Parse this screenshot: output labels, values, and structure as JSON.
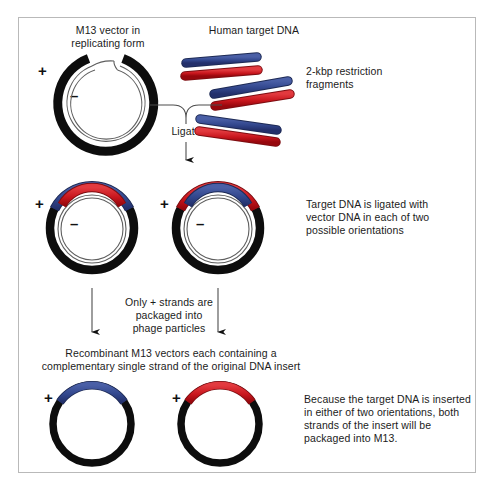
{
  "figure": {
    "title_top_left": "M13 vector in\nreplicating form",
    "title_top_right": "Human target DNA",
    "label_fragments": "2-kbp restriction\nfragments",
    "label_ligate": "Ligate",
    "label_ligated_note": "Target DNA is ligated with\nvector DNA in each of two\npossible orientations",
    "label_packaging": "Only + strands are\npackaged into\nphage particles",
    "label_recombinant": "Recombinant M13 vectors each containing a\ncomplementary single strand of the original DNA insert",
    "label_conclusion": "Because the target DNA is inserted\nin either of two orientations, both\nstrands of the insert will be\npackaged into M13.",
    "plus_sign": "+",
    "minus_sign": "–"
  },
  "colors": {
    "blue": "#31468c",
    "blue_dark": "#1d2a55",
    "red": "#c8161d",
    "red_dark": "#7d0d11",
    "black": "#0d0d0d",
    "thin_line": "#6a6a6a",
    "frame": "#b9b9b9",
    "background": "#ffffff"
  },
  "diagram_data": {
    "type": "diagram",
    "stages": [
      {
        "name": "top-stage",
        "elements": [
          {
            "kind": "vector-circle",
            "label": "M13 vector in replicating form",
            "strands": [
              "+",
              "–"
            ],
            "gap_top": true
          },
          {
            "kind": "dna-fragment-pair",
            "count": 3,
            "strand_colors": [
              "blue",
              "red"
            ],
            "label": "2-kbp restriction fragments"
          }
        ]
      },
      {
        "name": "ligation-stage",
        "elements": [
          {
            "kind": "ligated-circle",
            "orientation": "blue-outer-red-inner",
            "strands": [
              "+",
              "–"
            ]
          },
          {
            "kind": "ligated-circle",
            "orientation": "red-outer-blue-inner",
            "strands": [
              "+",
              "–"
            ]
          }
        ],
        "note": "Target DNA is ligated with vector DNA in each of two possible orientations"
      },
      {
        "name": "packaging-stage",
        "note": "Only + strands are packaged into phage particles"
      },
      {
        "name": "product-stage",
        "elements": [
          {
            "kind": "single-strand-circle",
            "insert_color": "blue",
            "strands": [
              "+"
            ]
          },
          {
            "kind": "single-strand-circle",
            "insert_color": "red",
            "strands": [
              "+"
            ]
          }
        ],
        "note": "Because the target DNA is inserted in either of two orientations, both strands of the insert will be packaged into M13."
      }
    ]
  }
}
